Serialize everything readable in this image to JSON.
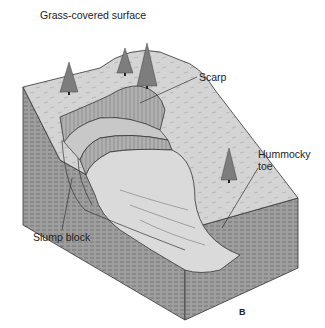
{
  "diagram": {
    "type": "block-diagram",
    "labels": {
      "surface": "Grass-covered surface",
      "scarp": "Scarp",
      "toe_line1": "Hummocky",
      "toe_line2": "toe",
      "slump_block": "Slump block"
    },
    "figure_letter": "B",
    "colors": {
      "top_surface": "#cfcfcf",
      "slump_surface": "#d9d9d9",
      "scarp_face": "#a8a8a8",
      "side_face": "#9e9e9e",
      "outline": "#333333",
      "tree": "#7a7a7a"
    }
  }
}
